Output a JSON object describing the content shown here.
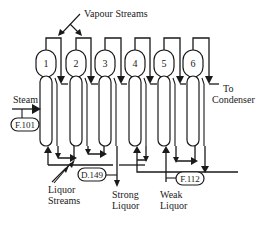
{
  "diagram": {
    "title_label": "Vapour Streams",
    "effects": [
      {
        "id": 1,
        "label": "1"
      },
      {
        "id": 2,
        "label": "2"
      },
      {
        "id": 3,
        "label": "3"
      },
      {
        "id": 4,
        "label": "4"
      },
      {
        "id": 5,
        "label": "5"
      },
      {
        "id": 6,
        "label": "6"
      }
    ],
    "inputs": {
      "steam_label": "Steam",
      "steam_tag": "F.101"
    },
    "outputs": {
      "condenser_label_1": "To",
      "condenser_label_2": "Condenser",
      "strong_liquor_1": "Strong",
      "strong_liquor_2": "Liquor",
      "strong_liquor_tag": "D.149",
      "weak_liquor_1": "Weak",
      "weak_liquor_2": "Liquor",
      "weak_liquor_tag": "F.112"
    },
    "liquor_streams_1": "Liquor",
    "liquor_streams_2": "Streams",
    "colors": {
      "line": "#1a1a1a",
      "background": "#ffffff"
    }
  }
}
